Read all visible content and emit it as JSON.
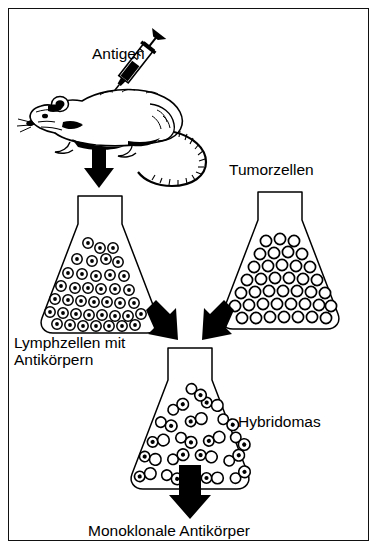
{
  "figure": {
    "language": "de",
    "background_color": "#ffffff",
    "ink_color": "#000000",
    "border_color": "#111111",
    "width": 379,
    "height": 557
  },
  "labels": {
    "antigen": "Antigen",
    "tumorzellen": "Tumorzellen",
    "lymphzellen": "Lymphzellen mit\nAntikörpern",
    "hybridomas": "Hybridomas",
    "monoklonale_antikoerper": "Monoklonale Antikörper"
  },
  "elements": {
    "mouse": "mouse-illustration",
    "syringe": "syringe-icon",
    "flask_left": "erlenmeyer-flask-lymph-cells",
    "flask_right": "erlenmeyer-flask-tumor-cells",
    "flask_bottom": "erlenmeyer-flask-hybridomas"
  },
  "cells": {
    "lymph_cell_style": "double-ring-circle",
    "lymph_cell_count": 44,
    "tumor_cell_style": "open-circle",
    "tumor_cell_count": 42,
    "hybridoma_cell_style": "fused-cell-pair",
    "hybridoma_cell_count": 26
  },
  "arrows": [
    {
      "name": "arrow-mouse-to-lymph-flask",
      "direction": "down"
    },
    {
      "name": "arrow-lymph-to-hybridoma-flask",
      "direction": "down-right"
    },
    {
      "name": "arrow-tumor-to-hybridoma-flask",
      "direction": "down-left"
    },
    {
      "name": "arrow-hybridoma-to-product",
      "direction": "down"
    }
  ]
}
